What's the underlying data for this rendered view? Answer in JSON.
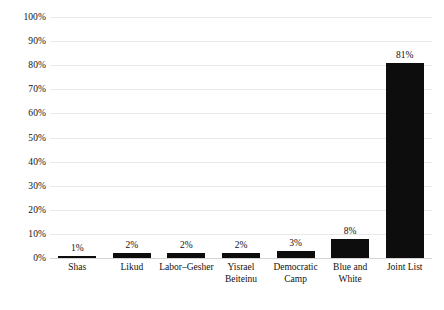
{
  "chart_data": {
    "type": "bar",
    "title": "",
    "xlabel": "",
    "ylabel": "",
    "categories": [
      "Shas",
      "Likud",
      "Labor–Gesher",
      "Yisrael Beiteinu",
      "Democratic Camp",
      "Blue and White",
      "Joint List"
    ],
    "category_lines": [
      [
        "Shas"
      ],
      [
        "Likud"
      ],
      [
        "Labor–Gesher"
      ],
      [
        "Yisrael",
        "Beiteinu"
      ],
      [
        "Democratic",
        "Camp"
      ],
      [
        "Blue and",
        "White"
      ],
      [
        "Joint List"
      ]
    ],
    "values": [
      1,
      2,
      2,
      2,
      3,
      8,
      81
    ],
    "value_labels": [
      "1%",
      "2%",
      "2%",
      "2%",
      "3%",
      "8%",
      "81%"
    ],
    "ylim": [
      0,
      100
    ],
    "y_ticks": [
      0,
      10,
      20,
      30,
      40,
      50,
      60,
      70,
      80,
      90,
      100
    ],
    "y_tick_labels": [
      "0%",
      "10%",
      "20%",
      "30%",
      "40%",
      "50%",
      "60%",
      "70%",
      "80%",
      "90%",
      "100%"
    ],
    "grid": true,
    "grid_axis": "y",
    "legend": false,
    "legend_position": "none",
    "bar_color": "#0d0d0d",
    "grid_color": "#e9e9e9",
    "background_color": "#ffffff",
    "data_labels": true,
    "data_label_position": "outside-end"
  }
}
